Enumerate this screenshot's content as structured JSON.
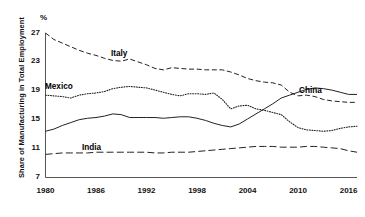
{
  "chart_data": {
    "type": "line",
    "title": "",
    "subtitle": "",
    "xlabel": "",
    "ylabel": "Share of Manufacturing in Total Employment",
    "unit_label": "%",
    "xlim": [
      1980,
      2017
    ],
    "ylim": [
      7,
      27
    ],
    "xticks": [
      1980,
      1986,
      1992,
      1998,
      2004,
      2010,
      2016
    ],
    "yticks": [
      7,
      11,
      15,
      19,
      23,
      27
    ],
    "grid": false,
    "legend": "inline-labels",
    "x": [
      1980,
      1981,
      1982,
      1983,
      1984,
      1985,
      1986,
      1987,
      1988,
      1989,
      1990,
      1991,
      1992,
      1993,
      1994,
      1995,
      1996,
      1997,
      1998,
      1999,
      2000,
      2001,
      2002,
      2003,
      2004,
      2005,
      2006,
      2007,
      2008,
      2009,
      2010,
      2011,
      2012,
      2013,
      2014,
      2015,
      2016,
      2017
    ],
    "series": [
      {
        "name": "Italy",
        "style": "dashed",
        "color": "#222222",
        "label_position": {
          "x": 111,
          "y": 49
        },
        "values": [
          27.0,
          26.1,
          25.6,
          25.1,
          24.6,
          24.2,
          23.9,
          23.5,
          23.2,
          23.1,
          23.4,
          23.0,
          22.6,
          22.1,
          21.9,
          22.2,
          22.1,
          22.0,
          22.0,
          21.9,
          21.9,
          21.9,
          21.6,
          21.2,
          20.7,
          20.4,
          20.2,
          20.1,
          19.8,
          18.8,
          18.3,
          18.4,
          18.2,
          17.8,
          17.6,
          17.5,
          17.4,
          17.4
        ]
      },
      {
        "name": "Mexico",
        "style": "dotted",
        "color": "#222222",
        "label_position": {
          "x": 45,
          "y": 82
        },
        "values": [
          18.4,
          18.3,
          18.2,
          18.0,
          18.4,
          18.6,
          18.7,
          18.9,
          19.3,
          19.5,
          19.6,
          19.5,
          19.4,
          19.1,
          18.8,
          18.5,
          18.3,
          18.6,
          18.6,
          18.5,
          18.7,
          17.8,
          16.5,
          16.9,
          17.0,
          16.5,
          16.3,
          16.0,
          15.7,
          14.7,
          13.9,
          13.6,
          13.5,
          13.4,
          13.5,
          13.8,
          14.0,
          14.1
        ]
      },
      {
        "name": "China",
        "style": "solid",
        "color": "#222222",
        "label_position": {
          "x": 299,
          "y": 86
        },
        "values": [
          13.4,
          13.7,
          14.2,
          14.6,
          15.0,
          15.2,
          15.3,
          15.5,
          15.8,
          15.7,
          15.3,
          15.3,
          15.3,
          15.3,
          15.2,
          15.3,
          15.4,
          15.4,
          15.2,
          14.9,
          14.5,
          14.2,
          14.0,
          14.4,
          15.1,
          15.8,
          16.5,
          17.2,
          18.0,
          18.4,
          18.8,
          19.2,
          19.4,
          19.3,
          19.1,
          18.8,
          18.5,
          18.5
        ]
      },
      {
        "name": "India",
        "style": "longdash",
        "color": "#222222",
        "label_position": {
          "x": 82,
          "y": 143
        },
        "values": [
          10.2,
          10.3,
          10.4,
          10.4,
          10.4,
          10.4,
          10.5,
          10.5,
          10.5,
          10.5,
          10.5,
          10.5,
          10.5,
          10.4,
          10.4,
          10.5,
          10.5,
          10.5,
          10.6,
          10.7,
          10.8,
          10.9,
          11.0,
          11.1,
          11.2,
          11.3,
          11.3,
          11.3,
          11.2,
          11.2,
          11.2,
          11.3,
          11.3,
          11.2,
          11.1,
          11.0,
          10.7,
          10.5
        ]
      }
    ]
  },
  "axis": {
    "percent": "%",
    "ylabel": "Share of Manufacturing in Total Employment",
    "yticks": [
      "27",
      "23",
      "19",
      "15",
      "11",
      "7"
    ],
    "xticks": [
      "1980",
      "1986",
      "1992",
      "1998",
      "2004",
      "2010",
      "2016"
    ]
  },
  "labels": {
    "italy": "Italy",
    "mexico": "Mexico",
    "china": "China",
    "india": "India"
  }
}
